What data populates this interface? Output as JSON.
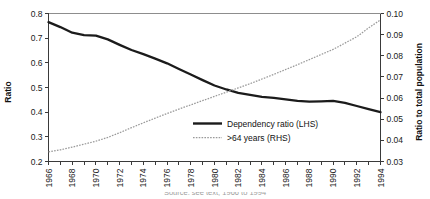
{
  "chart_data": {
    "type": "line",
    "title": "",
    "subtitle": "",
    "xlabel": "",
    "ylabel": "Ratio",
    "y2label": "Ratio to total population",
    "grid": false,
    "legend_position": "inside-lower-right",
    "xlim": [
      1966,
      1994
    ],
    "ylim": [
      0.2,
      0.8
    ],
    "y2lim": [
      0.03,
      0.1
    ],
    "x": [
      1966,
      1967,
      1968,
      1969,
      1970,
      1971,
      1972,
      1973,
      1974,
      1975,
      1976,
      1977,
      1978,
      1979,
      1980,
      1981,
      1982,
      1983,
      1984,
      1985,
      1986,
      1987,
      1988,
      1989,
      1990,
      1991,
      1992,
      1993,
      1994
    ],
    "x_tick_labels": [
      "1966",
      "1968",
      "1970",
      "1972",
      "1974",
      "1976",
      "1978",
      "1980",
      "1982",
      "1984",
      "1986",
      "1988",
      "1990",
      "1992",
      "1994"
    ],
    "y_tick_labels": [
      "0.2",
      "0.3",
      "0.4",
      "0.5",
      "0.6",
      "0.7",
      "0.8"
    ],
    "y2_tick_labels": [
      "0.03",
      "0.04",
      "0.05",
      "0.06",
      "0.07",
      "0.08",
      "0.09",
      "0.10"
    ],
    "series": [
      {
        "name": "Dependency ratio (LHS)",
        "axis": "left",
        "style": "solid",
        "color": "#1b1b1b",
        "values": [
          0.765,
          0.745,
          0.722,
          0.712,
          0.71,
          0.695,
          0.673,
          0.652,
          0.635,
          0.617,
          0.598,
          0.575,
          0.553,
          0.53,
          0.508,
          0.492,
          0.478,
          0.47,
          0.462,
          0.458,
          0.452,
          0.446,
          0.443,
          0.444,
          0.446,
          0.438,
          0.425,
          0.412,
          0.4
        ]
      },
      {
        "name": ">64 years (RHS)",
        "axis": "right",
        "style": "dotted",
        "color": "#9a9a9a",
        "values": [
          0.0345,
          0.0355,
          0.0368,
          0.0382,
          0.0396,
          0.0414,
          0.0436,
          0.046,
          0.0483,
          0.0505,
          0.0527,
          0.0548,
          0.0568,
          0.0588,
          0.0608,
          0.0628,
          0.0648,
          0.0668,
          0.069,
          0.0712,
          0.0735,
          0.0758,
          0.0782,
          0.0806,
          0.083,
          0.086,
          0.089,
          0.0932,
          0.097
        ]
      }
    ]
  },
  "legend": {
    "items": [
      {
        "label": "Dependency ratio (LHS)"
      },
      {
        "label": ">64 years (RHS)"
      }
    ]
  },
  "footer": {
    "clipped_caption": "Source: see text, 1966 to 1994"
  }
}
